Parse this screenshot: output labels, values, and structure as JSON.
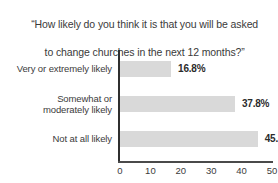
{
  "chart_data": {
    "type": "bar",
    "orientation": "horizontal",
    "title": "“How likely do you think it is that you will be asked\nto change churches in the next 12 months?”",
    "title_line1": "“How likely do you think it is that you will be asked",
    "title_line2": "to change churches in the next 12 months?”",
    "categories": [
      "Very or extremely likely",
      "Somewhat or\nmoderately likely",
      "Not at all likely"
    ],
    "values": [
      16.8,
      37.8,
      45.3
    ],
    "value_labels": [
      "16.8%",
      "37.8%",
      "45.3%"
    ],
    "xlabel": "",
    "ylabel": "",
    "xlim": [
      0,
      50
    ],
    "xticks": [
      0,
      10,
      20,
      30,
      40,
      50
    ],
    "xtick_labels": [
      "0",
      "10",
      "20",
      "30",
      "40",
      "50"
    ],
    "grid": false,
    "legend": false,
    "bar_color": "#d9d9d9",
    "axis_color": "#2f2f2f",
    "text_color": "#3b3b3b",
    "value_label_color": "#2b2b2b"
  }
}
